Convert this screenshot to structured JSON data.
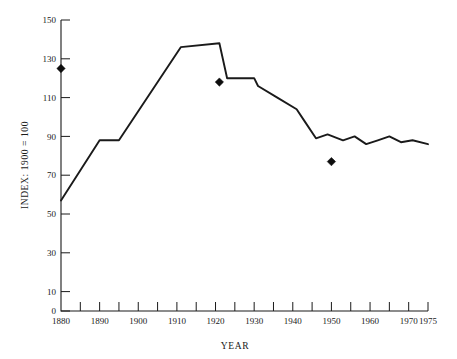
{
  "chart_data": {
    "type": "line",
    "title": "",
    "xlabel": "YEAR",
    "ylabel": "INDEX: 1900 = 100",
    "xlim": [
      1880,
      1975
    ],
    "ylim": [
      0,
      150
    ],
    "grid": false,
    "legend": "none",
    "ytick_values": [
      0,
      10,
      30,
      50,
      70,
      90,
      110,
      130,
      150
    ],
    "ytick_labels": [
      "0",
      "10",
      "30",
      "50",
      "70",
      "90",
      "110",
      "130",
      "150"
    ],
    "xtick_values": [
      1880,
      1890,
      1900,
      1910,
      1920,
      1930,
      1940,
      1950,
      1960,
      1970,
      1975
    ],
    "xtick_labels": [
      "1880",
      "1890",
      "1900",
      "1910",
      "1920",
      "1930",
      "1940",
      "1950",
      "1960",
      "1970",
      "1975"
    ],
    "xtick_minor_values": [
      1885,
      1895,
      1905,
      1915,
      1925,
      1935,
      1945,
      1955,
      1965
    ],
    "series": [
      {
        "name": "index-line",
        "style": "line",
        "x": [
          1880,
          1890,
          1895,
          1911,
          1921,
          1923,
          1930,
          1931,
          1936,
          1941,
          1943,
          1946,
          1949,
          1953,
          1956,
          1959,
          1962,
          1965,
          1968,
          1971,
          1975
        ],
        "y": [
          57,
          88,
          88,
          136,
          138,
          120,
          120,
          116,
          110,
          104,
          98,
          89,
          91,
          88,
          90,
          86,
          88,
          90,
          87,
          88,
          86
        ]
      },
      {
        "name": "diamond-markers",
        "style": "scatter",
        "marker": "diamond",
        "x": [
          1880,
          1921,
          1950
        ],
        "y": [
          125,
          118,
          77
        ]
      }
    ]
  },
  "colors": {
    "line": "#1a1a1a",
    "marker": "#0d0d0d",
    "axis": "#1a1a1a",
    "background": "#ffffff"
  }
}
